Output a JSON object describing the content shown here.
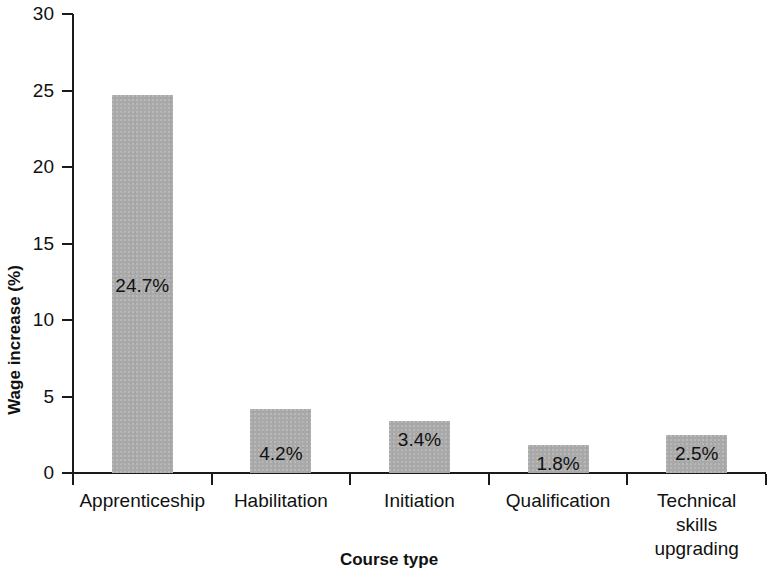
{
  "chart_data": {
    "type": "bar",
    "title": "",
    "xlabel": "Course type",
    "ylabel": "Wage increase (%)",
    "categories": [
      "Apprenticeship",
      "Habilitation",
      "Initiation",
      "Qualification",
      "Technical skills\nupgrading"
    ],
    "values": [
      24.7,
      4.2,
      3.4,
      1.8,
      2.5
    ],
    "data_labels": [
      "24.7%",
      "4.2%",
      "3.4%",
      "1.8%",
      "2.5%"
    ],
    "ylim": [
      0,
      30
    ],
    "yticks": [
      0,
      5,
      10,
      15,
      20,
      25,
      30
    ],
    "ytick_labels": [
      "0",
      "5",
      "10",
      "15",
      "20",
      "25",
      "30"
    ],
    "grid": false,
    "legend": null,
    "bar_color": "#a9a9a9",
    "axis_color": "#1a1a1a",
    "text_color": "#111111",
    "background": "#ffffff"
  },
  "axis_titles": {
    "y": "Wage increase (%)",
    "x": "Course type"
  }
}
